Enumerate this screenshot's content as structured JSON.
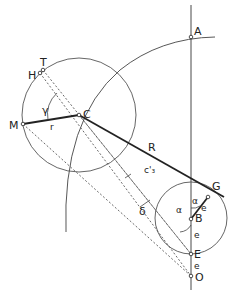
{
  "diagram": {
    "labels": {
      "A": "A",
      "T": "T",
      "H": "H",
      "C": "C",
      "M": "M",
      "r": "r",
      "gamma": "γ",
      "R": "R",
      "c3": "c'₃",
      "delta": "δ",
      "G": "G",
      "alpha1": "α",
      "alpha2": "α",
      "e1": "e",
      "B": "B",
      "e2": "e",
      "E": "E",
      "e3": "e",
      "O": "O"
    },
    "colors": {
      "stroke": "#333333",
      "background": "#ffffff"
    }
  }
}
